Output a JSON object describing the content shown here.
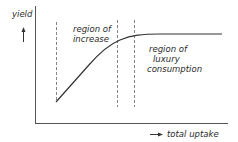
{
  "diagram": {
    "y_axis_label": "yield",
    "x_axis_label": "total uptake",
    "regions": {
      "increase": [
        "region of",
        "increase"
      ],
      "luxury": [
        "region of",
        "luxury",
        "consumption"
      ]
    },
    "colors": {
      "line": "#333333",
      "axis": "#555555",
      "dashed": "#666666",
      "text": "#2a2a2a"
    }
  }
}
